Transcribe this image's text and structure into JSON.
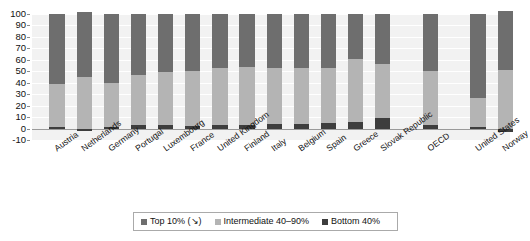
{
  "chart_data": {
    "type": "bar",
    "stacked": true,
    "title": "",
    "xlabel": "",
    "ylabel": "",
    "ylim": [
      -10,
      100
    ],
    "yticks": [
      -10,
      0,
      10,
      20,
      30,
      40,
      50,
      60,
      70,
      80,
      90,
      100
    ],
    "grid": true,
    "legend_position": "bottom",
    "categories": [
      "Austria",
      "Netherlands",
      "Germany",
      "Portugal",
      "Luxembourg",
      "France",
      "United Kingdom",
      "Finland",
      "Italy",
      "Belgium",
      "Spain",
      "Greece",
      "Slovak Republic",
      "OECD",
      "United States",
      "Norway"
    ],
    "series": [
      {
        "name": "Bottom 40%",
        "color": "#3d3d3d",
        "values": [
          1,
          -2,
          1,
          3,
          3,
          2,
          3,
          3,
          4,
          4,
          5,
          6,
          9,
          3,
          1,
          -3
        ]
      },
      {
        "name": "Intermediate 40–90%",
        "color": "#b4b4b4",
        "values": [
          38,
          45,
          39,
          44,
          46,
          48,
          50,
          51,
          49,
          49,
          48,
          55,
          47,
          47,
          26,
          51
        ]
      },
      {
        "name": "Top 10%",
        "color": "#6e6e6e",
        "values": [
          61,
          57,
          60,
          53,
          51,
          50,
          47,
          46,
          47,
          47,
          47,
          39,
          44,
          50,
          73,
          52
        ]
      }
    ],
    "legend": [
      {
        "label": "Top 10% (↘)",
        "color": "#6e6e6e"
      },
      {
        "label": "Intermediate 40–90%",
        "color": "#b4b4b4"
      },
      {
        "label": "Bottom 40%",
        "color": "#3d3d3d"
      }
    ]
  }
}
